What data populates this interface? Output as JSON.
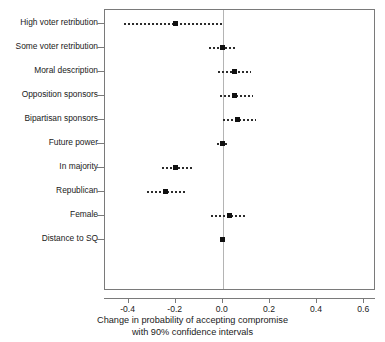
{
  "chart_data": {
    "type": "scatter",
    "title": "",
    "xlabel": "Change in probability of accepting compromise",
    "xlabel_line2": "with 90% confidence intervals",
    "ylabel": "",
    "xlim": [
      -0.5,
      0.65
    ],
    "xticks": [
      -0.4,
      -0.2,
      0.0,
      0.2,
      0.4,
      0.6
    ],
    "xticklabels": [
      "-0.4",
      "-0.2",
      "0.0",
      "0.2",
      "0.4",
      "0.6"
    ],
    "grid": false,
    "legend": "none",
    "reference_line": 0.0,
    "confidence_level": "90%",
    "categories": [
      "High voter retribution",
      "Some voter retribution",
      "Moral description",
      "Opposition sponsors",
      "Bipartisan sponsors",
      "Future power",
      "In majority",
      "Republican",
      "Female",
      "Distance to SQ"
    ],
    "values": [
      -0.2,
      0.0,
      0.05,
      0.05,
      0.065,
      0.0,
      -0.2,
      -0.24,
      0.03,
      0.0
    ],
    "ci_low": [
      -0.42,
      -0.06,
      -0.02,
      -0.01,
      0.0,
      -0.025,
      -0.26,
      -0.32,
      -0.05,
      0.0
    ],
    "ci_high": [
      0.0,
      0.06,
      0.12,
      0.13,
      0.14,
      0.025,
      -0.13,
      -0.16,
      0.1,
      0.0
    ],
    "points": [
      {
        "label": "High voter retribution",
        "estimate": -0.2,
        "ci_low": -0.42,
        "ci_high": 0.0
      },
      {
        "label": "Some voter retribution",
        "estimate": 0.0,
        "ci_low": -0.06,
        "ci_high": 0.06
      },
      {
        "label": "Moral description",
        "estimate": 0.05,
        "ci_low": -0.02,
        "ci_high": 0.12
      },
      {
        "label": "Opposition sponsors",
        "estimate": 0.05,
        "ci_low": -0.01,
        "ci_high": 0.13
      },
      {
        "label": "Bipartisan sponsors",
        "estimate": 0.065,
        "ci_low": 0.0,
        "ci_high": 0.14
      },
      {
        "label": "Future power",
        "estimate": 0.0,
        "ci_low": -0.025,
        "ci_high": 0.025
      },
      {
        "label": "In majority",
        "estimate": -0.2,
        "ci_low": -0.26,
        "ci_high": -0.13
      },
      {
        "label": "Republican",
        "estimate": -0.24,
        "ci_low": -0.32,
        "ci_high": -0.16
      },
      {
        "label": "Female",
        "estimate": 0.03,
        "ci_low": -0.05,
        "ci_high": 0.1
      },
      {
        "label": "Distance to SQ",
        "estimate": 0.0,
        "ci_low": 0.0,
        "ci_high": 0.0
      }
    ]
  },
  "colors": {
    "point": "#111111",
    "interval": "#2b2b2b",
    "axis": "#7a7a7a",
    "reference_line": "#b4b4b4",
    "background": "#ffffff"
  }
}
